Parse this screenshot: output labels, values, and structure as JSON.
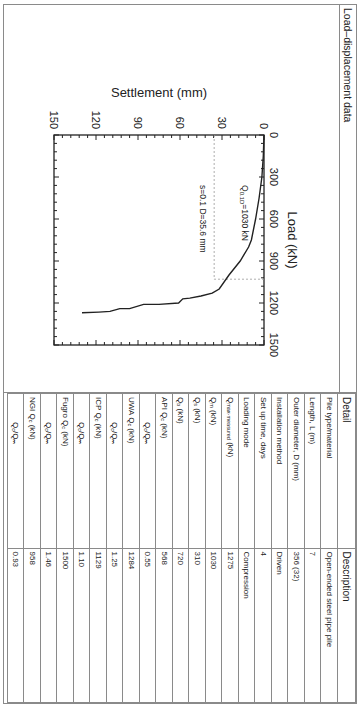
{
  "panel": {
    "left_title": "Load–displacement data"
  },
  "table": {
    "headers": [
      "Detail",
      "Description"
    ],
    "rows": [
      {
        "detail": "Pile type/material",
        "sub": "",
        "detail_tail": "",
        "value": "Open-ended steel pipe pile",
        "indent": false
      },
      {
        "detail": "Length, L (m)",
        "sub": "",
        "detail_tail": "",
        "value": "7",
        "indent": false
      },
      {
        "detail": "Outer diameter, D (mm)",
        "sub": "",
        "detail_tail": "",
        "value": "356 (32)",
        "indent": false
      },
      {
        "detail": "Installation method",
        "sub": "",
        "detail_tail": "",
        "value": "Driven",
        "indent": false
      },
      {
        "detail": "Set up time, days",
        "sub": "",
        "detail_tail": "",
        "value": "4",
        "indent": false
      },
      {
        "detail": "Loading mode",
        "sub": "",
        "detail_tail": "",
        "value": "Compression",
        "indent": false
      },
      {
        "detail": "Q",
        "sub": "max-measured",
        "detail_tail": " (kN)",
        "value": "1275",
        "indent": false
      },
      {
        "detail": "Q",
        "sub": "m",
        "detail_tail": " (kN)",
        "value": "1030",
        "indent": false
      },
      {
        "detail": "Q",
        "sub": "s",
        "detail_tail": " (kN)",
        "value": "310",
        "indent": false
      },
      {
        "detail": "Q",
        "sub": "b",
        "detail_tail": " (kN)",
        "value": "720",
        "indent": false
      },
      {
        "detail": "API Q",
        "sub": "c",
        "detail_tail": " (kN)",
        "value": "568",
        "indent": false
      },
      {
        "detail": "Q",
        "sub": "c",
        "detail_tail": "/Qₘ",
        "value": "0.55",
        "indent": true
      },
      {
        "detail": "UWA Q",
        "sub": "c",
        "detail_tail": " (kN)",
        "value": "1284",
        "indent": false
      },
      {
        "detail": "Q",
        "sub": "c",
        "detail_tail": "/Qₘ",
        "value": "1.25",
        "indent": true
      },
      {
        "detail": "ICP Q",
        "sub": "c",
        "detail_tail": " (kN)",
        "value": "1129",
        "indent": false
      },
      {
        "detail": "Q",
        "sub": "c",
        "detail_tail": "/Qₘ",
        "value": "1.10",
        "indent": true
      },
      {
        "detail": "Fugro Q",
        "sub": "c",
        "detail_tail": " (kN)",
        "value": "1500",
        "indent": false
      },
      {
        "detail": "Q",
        "sub": "c",
        "detail_tail": "/Qₘ",
        "value": "1.46",
        "indent": true
      },
      {
        "detail": "NGI Q",
        "sub": "c",
        "detail_tail": " (kN)",
        "value": "958",
        "indent": false
      },
      {
        "detail": "Q",
        "sub": "c",
        "detail_tail": "/Qₘ",
        "value": "0.93",
        "indent": true
      }
    ]
  },
  "chart_data": {
    "type": "line",
    "title": "",
    "xlabel": "Load (kN)",
    "ylabel": "Settlement (mm)",
    "xlim": [
      0,
      1500
    ],
    "ylim": [
      0,
      150
    ],
    "y_inverted": true,
    "x_ticks": [
      0,
      300,
      600,
      900,
      1200,
      1500
    ],
    "y_ticks": [
      0,
      30,
      60,
      90,
      120,
      150
    ],
    "grid": false,
    "legend": null,
    "series": [
      {
        "name": "Measured load–settlement",
        "x": [
          0,
          150,
          300,
          450,
          600,
          750,
          800,
          900,
          1000,
          1100,
          1130,
          1150,
          1165,
          1170,
          1200,
          1210,
          1210,
          1240,
          1240,
          1260,
          1265,
          1270
        ],
        "y": [
          0,
          0.5,
          1.5,
          3.5,
          6,
          9,
          11,
          17,
          25,
          32,
          37,
          45,
          53,
          58,
          61,
          75,
          86,
          96,
          103,
          110,
          118,
          130
        ]
      }
    ],
    "annotations": [
      {
        "text_main": "Q",
        "text_sub": "0.1D",
        "text_tail": "=1030 kN",
        "type": "label"
      },
      {
        "text": "s=0.1 D=35.6 mm",
        "type": "dashed-line-label",
        "settlement": 35.6,
        "load": 1030
      }
    ]
  }
}
